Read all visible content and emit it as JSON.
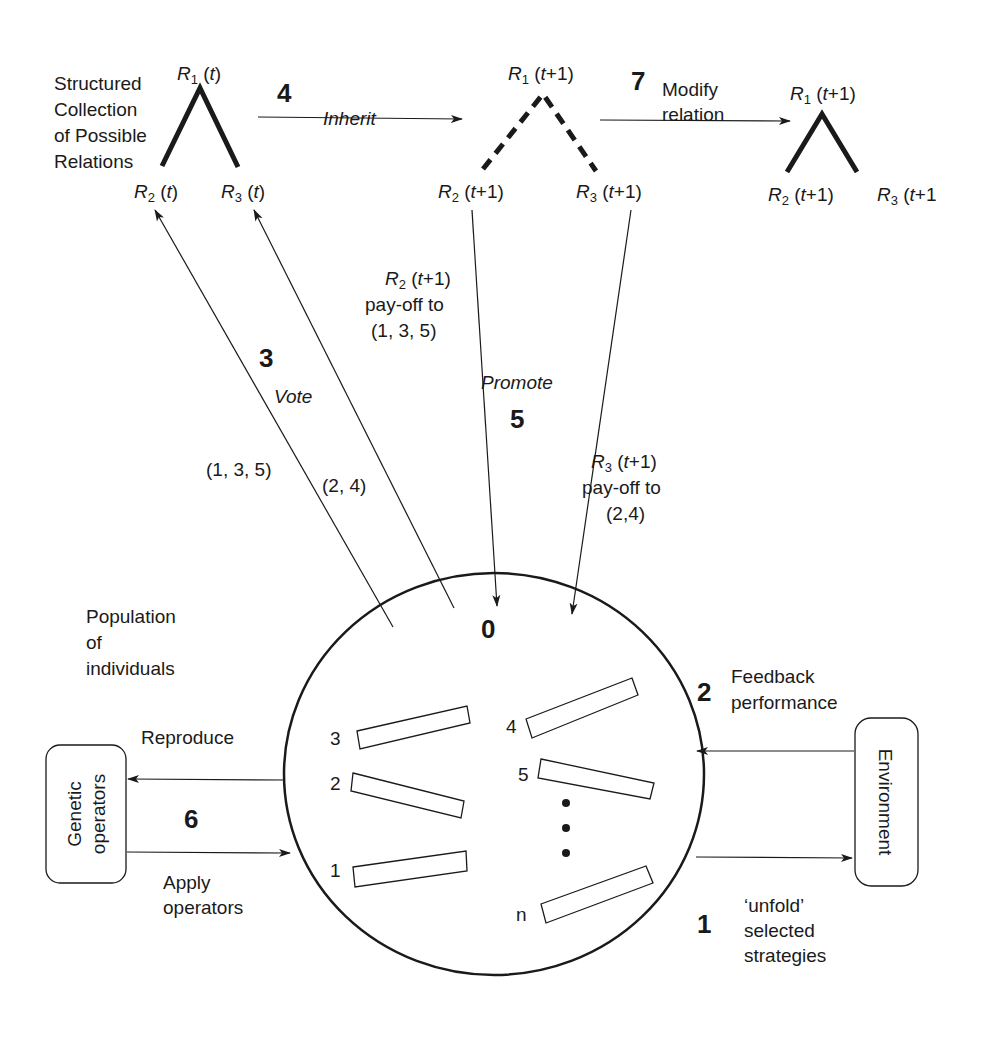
{
  "title_block": {
    "collection_label": [
      "Structured",
      "Collection",
      "of Possible",
      "Relations"
    ]
  },
  "trees": {
    "t": {
      "root": [
        "R",
        "1",
        " (",
        "t",
        ")"
      ],
      "left": [
        "R",
        "2",
        " (",
        "t",
        ")"
      ],
      "right": [
        "R",
        "3",
        " (",
        "t",
        ")"
      ],
      "style": "solid"
    },
    "t1_inherited": {
      "root": [
        "R",
        "1",
        " (",
        "t",
        "+1)"
      ],
      "left": [
        "R",
        "2",
        " (",
        "t",
        "+1)"
      ],
      "right": [
        "R",
        "3",
        " (",
        "t",
        "+1)"
      ],
      "style": "dashed"
    },
    "t1_modified": {
      "root": [
        "R",
        "1",
        " (",
        "t",
        "+1)"
      ],
      "left": [
        "R",
        "2",
        " (",
        "t",
        "+1)"
      ],
      "right": [
        "R",
        "3",
        " (",
        "t",
        "+1"
      ],
      "style": "solid"
    }
  },
  "steps": {
    "s0": {
      "number": "0"
    },
    "s1": {
      "number": "1",
      "label": [
        "‘unfold’",
        "selected",
        "strategies"
      ]
    },
    "s2": {
      "number": "2",
      "label": [
        "Feedback",
        "performance"
      ]
    },
    "s3": {
      "number": "3",
      "label": "Vote",
      "left_group": "(1, 3, 5)",
      "right_group": "(2, 4)"
    },
    "s4": {
      "number": "4",
      "label": "Inherit"
    },
    "s5": {
      "number": "5",
      "label": "Promote",
      "payoff_r2": {
        "head": [
          "R",
          "2",
          " (",
          "t",
          "+1)"
        ],
        "lines": [
          "pay-off to",
          "(1, 3, 5)"
        ]
      },
      "payoff_r3": {
        "head": [
          "R",
          "3",
          " (",
          "t",
          "+1)"
        ],
        "lines": [
          "pay-off to",
          "(2,4)"
        ]
      }
    },
    "s6": {
      "number": "6",
      "top_label": "Reproduce",
      "bottom_label": [
        "Apply",
        "operators"
      ]
    },
    "s7": {
      "number": "7",
      "label": [
        "Modify",
        "relation"
      ]
    }
  },
  "population": {
    "label": [
      "Population",
      "of",
      "individuals"
    ],
    "strategies": [
      "3",
      "2",
      "1",
      "4",
      "5",
      "n"
    ],
    "ellipsis": "•••"
  },
  "boxes": {
    "genetic_operators": [
      "Genetic",
      "operators"
    ],
    "environment": "Environment"
  }
}
